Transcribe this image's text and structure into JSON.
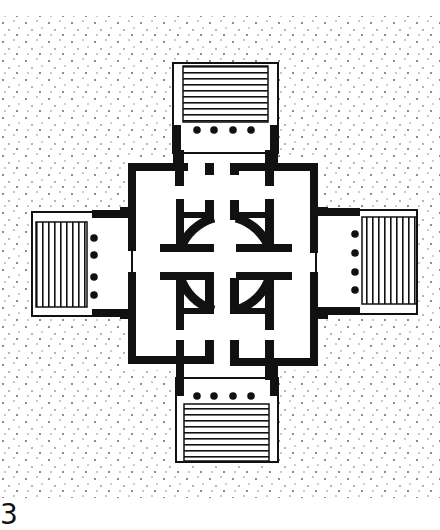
{
  "figure": {
    "caption_number": "3",
    "colors": {
      "wall": "#111111",
      "ground_stipple": "#555555",
      "background": "#ffffff"
    }
  },
  "elements": {
    "porticoes": [
      {
        "side": "north",
        "columns": 4,
        "steps": "horizontal-lines"
      },
      {
        "side": "south",
        "columns": 4,
        "steps": "horizontal-lines"
      },
      {
        "side": "west",
        "columns": 4,
        "steps": "vertical-lines"
      },
      {
        "side": "east",
        "columns": 4,
        "steps": "vertical-lines"
      }
    ],
    "central_hall": "circular rotunda",
    "corner_blocks": 4
  }
}
